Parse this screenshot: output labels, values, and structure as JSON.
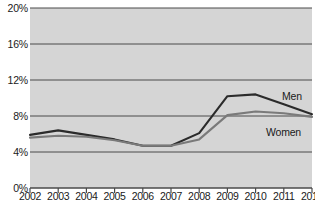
{
  "chart_data": {
    "type": "line",
    "title": "",
    "subtitle": "",
    "xlabel": "",
    "ylabel": "",
    "categories": [
      "2002",
      "2003",
      "2004",
      "2005",
      "2006",
      "2007",
      "2008",
      "2009",
      "2010",
      "2011",
      "2012"
    ],
    "x": [
      2002,
      2003,
      2004,
      2005,
      2006,
      2007,
      2008,
      2009,
      2010,
      2011,
      2012
    ],
    "series": [
      {
        "name": "Men",
        "color": "#2b2b2b",
        "values": [
          5.9,
          6.4,
          5.9,
          5.4,
          4.7,
          4.7,
          6.1,
          10.2,
          10.4,
          9.3,
          8.2
        ]
      },
      {
        "name": "Women",
        "color": "#7a7a7a",
        "values": [
          5.6,
          5.8,
          5.7,
          5.3,
          4.7,
          4.7,
          5.4,
          8.1,
          8.5,
          8.3,
          7.9
        ]
      }
    ],
    "ylim": [
      0,
      20
    ],
    "yticks": [
      0,
      4,
      8,
      12,
      16,
      20
    ],
    "ytick_labels": [
      "0%",
      "4%",
      "8%",
      "12%",
      "16%",
      "20%"
    ],
    "xlim": [
      2002,
      2012
    ],
    "grid": true,
    "grid_axis": "y",
    "legend": "inline-right-labels",
    "annotations": [
      {
        "text": "Men",
        "series": "Men",
        "position": "right-of-line-end"
      },
      {
        "text": "Women",
        "series": "Women",
        "position": "right-of-line-end"
      }
    ],
    "plot_background": "#d5d5d5",
    "gridline_color": "#4a4a4a",
    "page_background": "#ffffff"
  }
}
